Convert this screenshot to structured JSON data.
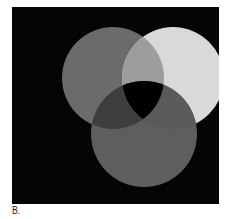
{
  "figure": {
    "caption": "B.",
    "background": "#050505",
    "circles": [
      {
        "name": "top-left",
        "cx": 77,
        "cy": 71,
        "r": 51,
        "color": "#6b6b6b"
      },
      {
        "name": "top-right",
        "cx": 127,
        "cy": 71,
        "r": 51,
        "color": "#d9d9d9"
      },
      {
        "name": "bottom",
        "cx": 104,
        "cy": 125,
        "r": 53,
        "color": "#5e5e5e"
      }
    ],
    "overlaps": {
      "top-left_top-right": "#9d9d9d",
      "top-left_bottom": "#3e3e3e",
      "top-right_bottom": "#5a5a5a",
      "center": "#000000"
    }
  }
}
